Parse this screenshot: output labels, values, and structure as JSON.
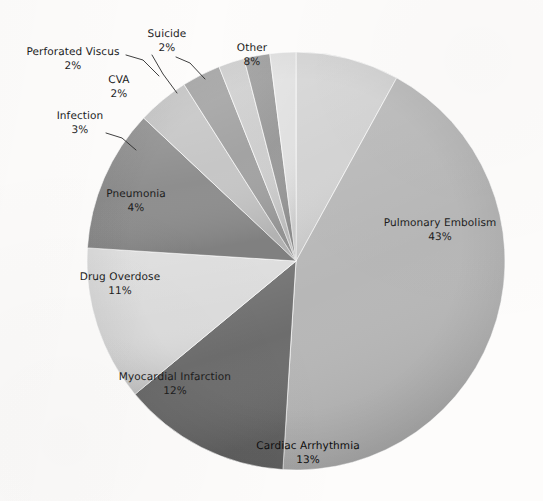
{
  "chart_data": {
    "type": "pie",
    "title": "",
    "subtitle": "",
    "xlabel": "",
    "ylabel": "",
    "legend_position": "none",
    "grid": false,
    "value_unit": "%",
    "start_angle_deg": 0,
    "direction": "clockwise",
    "categories": [
      "Other",
      "Pulmonary Embolism",
      "Cardiac Arrhythmia",
      "Myocardial Infarction",
      "Drug Overdose",
      "Pneumonia",
      "Infection",
      "CVA",
      "Perforated Viscus",
      "Suicide"
    ],
    "values": [
      8,
      43,
      13,
      12,
      11,
      4,
      3,
      2,
      2,
      2
    ],
    "labels": [
      "Other",
      "Pulmonary Embolism",
      "Cardiac Arrhythmia",
      "Myocardial Infarction",
      "Drug Overdose",
      "Pneumonia",
      "Infection",
      "CVA",
      "Perforated Viscus",
      "Suicide"
    ],
    "percent_labels": [
      "8%",
      "43%",
      "13%",
      "12%",
      "11%",
      "4%",
      "3%",
      "2%",
      "2%",
      "2%"
    ],
    "colors": [
      "#d4d4d4",
      "#b7b7b7",
      "#6d6d6d",
      "#dcdcdc",
      "#8e8e8e",
      "#c6c6c6",
      "#a3a3a3",
      "#cfcfcf",
      "#9b9b9b",
      "#e2e2e2"
    ]
  },
  "slices": [
    {
      "name": "Other",
      "pct": "8%",
      "label": "Other"
    },
    {
      "name": "Pulmonary Embolism",
      "pct": "43%",
      "label": "Pulmonary Embolism"
    },
    {
      "name": "Cardiac Arrhythmia",
      "pct": "13%",
      "label": "Cardiac Arrhythmia"
    },
    {
      "name": "Myocardial Infarction",
      "pct": "12%",
      "label": "Myocardial Infarction"
    },
    {
      "name": "Drug Overdose",
      "pct": "11%",
      "label": "Drug Overdose"
    },
    {
      "name": "Pneumonia",
      "pct": "4%",
      "label": "Pneumonia"
    },
    {
      "name": "Infection",
      "pct": "3%",
      "label": "Infection"
    },
    {
      "name": "CVA",
      "pct": "2%",
      "label": "CVA"
    },
    {
      "name": "Perforated Viscus",
      "pct": "2%",
      "label": "Perforated Viscus"
    },
    {
      "name": "Suicide",
      "pct": "2%",
      "label": "Suicide"
    }
  ],
  "geometry": {
    "center_x": 296,
    "center_y": 261,
    "radius": 209
  }
}
